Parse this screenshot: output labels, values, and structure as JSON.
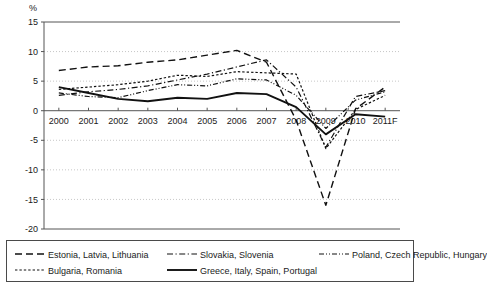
{
  "chart_data": {
    "type": "line",
    "title": "",
    "xlabel": "",
    "ylabel": "%",
    "ylim": [
      -20,
      15
    ],
    "ytick_values": [
      15,
      10,
      5,
      0,
      -5,
      -10,
      -15,
      -20
    ],
    "ytick_labels": [
      "15",
      "10",
      "5",
      "0",
      "-5",
      "-10",
      "-15",
      "-20"
    ],
    "grid": true,
    "legend_position": "bottom",
    "categories": [
      "2000",
      "2001",
      "2002",
      "2003",
      "2004",
      "2005",
      "2006",
      "2007",
      "2008",
      "2009",
      "2010",
      "2011F"
    ],
    "series": [
      {
        "name": "Estonia, Latvia, Lithuania",
        "style": "long-dash",
        "values": [
          6.8,
          7.4,
          7.6,
          8.2,
          8.6,
          9.4,
          10.2,
          8.2,
          -1.6,
          -16.0,
          0.3,
          4.0
        ]
      },
      {
        "name": "Slovakia, Slovenia",
        "style": "dash-dot",
        "values": [
          2.6,
          3.2,
          3.6,
          4.2,
          5.2,
          6.2,
          7.4,
          8.6,
          4.0,
          -6.2,
          2.4,
          3.4
        ]
      },
      {
        "name": "Poland, Czech Republic, Hungary",
        "style": "dash-dot-dot",
        "values": [
          3.0,
          2.4,
          2.2,
          3.4,
          4.4,
          4.2,
          5.4,
          5.2,
          2.6,
          -3.0,
          1.8,
          3.2
        ]
      },
      {
        "name": "Bulgaria, Romania",
        "style": "dotted",
        "values": [
          3.6,
          4.0,
          4.4,
          5.0,
          6.0,
          5.8,
          6.6,
          6.4,
          6.2,
          -6.4,
          0.2,
          2.6
        ]
      },
      {
        "name": "Greece, Italy, Spain, Portugal",
        "style": "solid",
        "values": [
          4.0,
          3.0,
          2.0,
          1.6,
          2.2,
          2.0,
          3.0,
          2.8,
          0.6,
          -4.0,
          -0.6,
          -1.0
        ]
      }
    ]
  },
  "axis": {
    "unit_label": "%"
  },
  "legend": {
    "entries": [
      {
        "label": "Estonia, Latvia, Lithuania"
      },
      {
        "label": "Slovakia, Slovenia"
      },
      {
        "label": "Poland, Czech Republic, Hungary"
      },
      {
        "label": "Bulgaria, Romania"
      },
      {
        "label": "Greece, Italy, Spain, Portugal"
      }
    ]
  }
}
